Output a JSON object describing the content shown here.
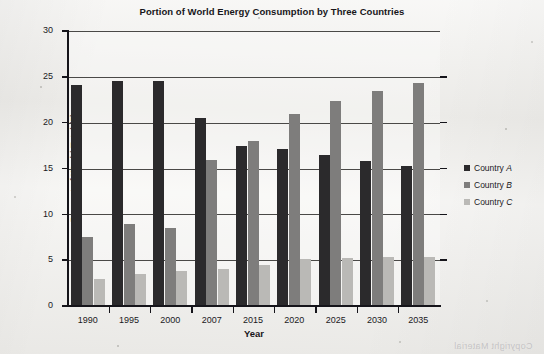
{
  "chart_data": {
    "type": "bar",
    "title": "Portion of World Energy Consumption by Three Countries",
    "xlabel": "Year",
    "ylabel": "Percent of World Total (5)",
    "categories": [
      "1990",
      "1995",
      "2000",
      "2007",
      "2015",
      "2020",
      "2025",
      "2030",
      "2035"
    ],
    "series": [
      {
        "name": "Country A",
        "values": [
          24.1,
          24.5,
          24.5,
          20.5,
          17.5,
          17.1,
          16.5,
          15.8,
          15.3
        ],
        "color": "#2b2a2c"
      },
      {
        "name": "Country B",
        "values": [
          7.5,
          9.0,
          8.5,
          15.9,
          18.0,
          21.0,
          22.4,
          23.5,
          24.3
        ],
        "color": "#7e7d7c"
      },
      {
        "name": "Country C",
        "values": [
          3.0,
          3.5,
          3.8,
          4.0,
          4.5,
          5.1,
          5.2,
          5.3,
          5.4
        ],
        "color": "#bab9b6"
      }
    ],
    "ylim": [
      0,
      30
    ],
    "yticks": [
      0,
      5,
      10,
      15,
      20,
      25,
      30
    ],
    "ytick_labels": [
      "0",
      "5",
      "10",
      "15",
      "20",
      "25",
      "30"
    ],
    "grid": true,
    "legend_position": "right",
    "legend": [
      {
        "prefix": "Country ",
        "italic": "A"
      },
      {
        "prefix": "Country ",
        "italic": "B"
      },
      {
        "prefix": "Country ",
        "italic": "C"
      }
    ]
  },
  "artifacts": {
    "bleed_text": "Copyright Material"
  }
}
